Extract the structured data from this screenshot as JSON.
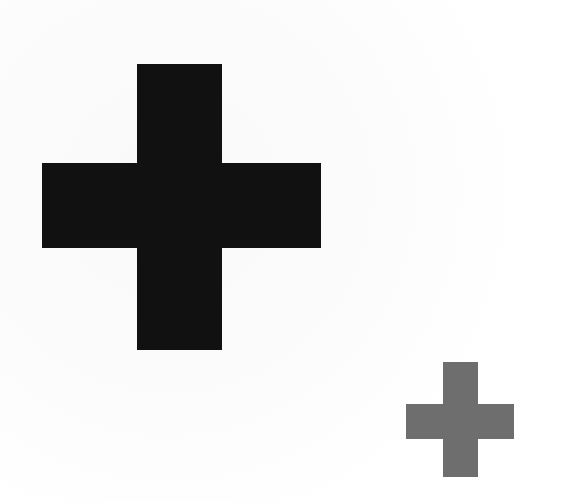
{
  "canvas": {
    "width": 566,
    "height": 502,
    "background_color": "#ffffff",
    "paper_tint_color": "#fbfbfb"
  },
  "shapes": [
    {
      "name": "large-black-plus",
      "icon": "plus-icon",
      "color": "#111111",
      "label": "",
      "geometry": {
        "left": 42,
        "top": 64,
        "width": 279,
        "height": 286,
        "vertical_arm_width": 85,
        "horizontal_arm_height": 85,
        "vertical_arm_left": 137,
        "vertical_arm_right": 222,
        "horizontal_arm_top": 163,
        "horizontal_arm_bottom": 248,
        "center_x": 181,
        "center_y": 206
      }
    },
    {
      "name": "small-gray-plus",
      "icon": "plus-icon",
      "color": "#6e6e6e",
      "label": "",
      "geometry": {
        "left": 406,
        "top": 362,
        "width": 108,
        "height": 115,
        "vertical_arm_width": 35,
        "horizontal_arm_height": 35,
        "vertical_arm_left": 443,
        "vertical_arm_right": 478,
        "horizontal_arm_top": 404,
        "horizontal_arm_bottom": 439,
        "center_x": 460,
        "center_y": 420
      }
    }
  ]
}
